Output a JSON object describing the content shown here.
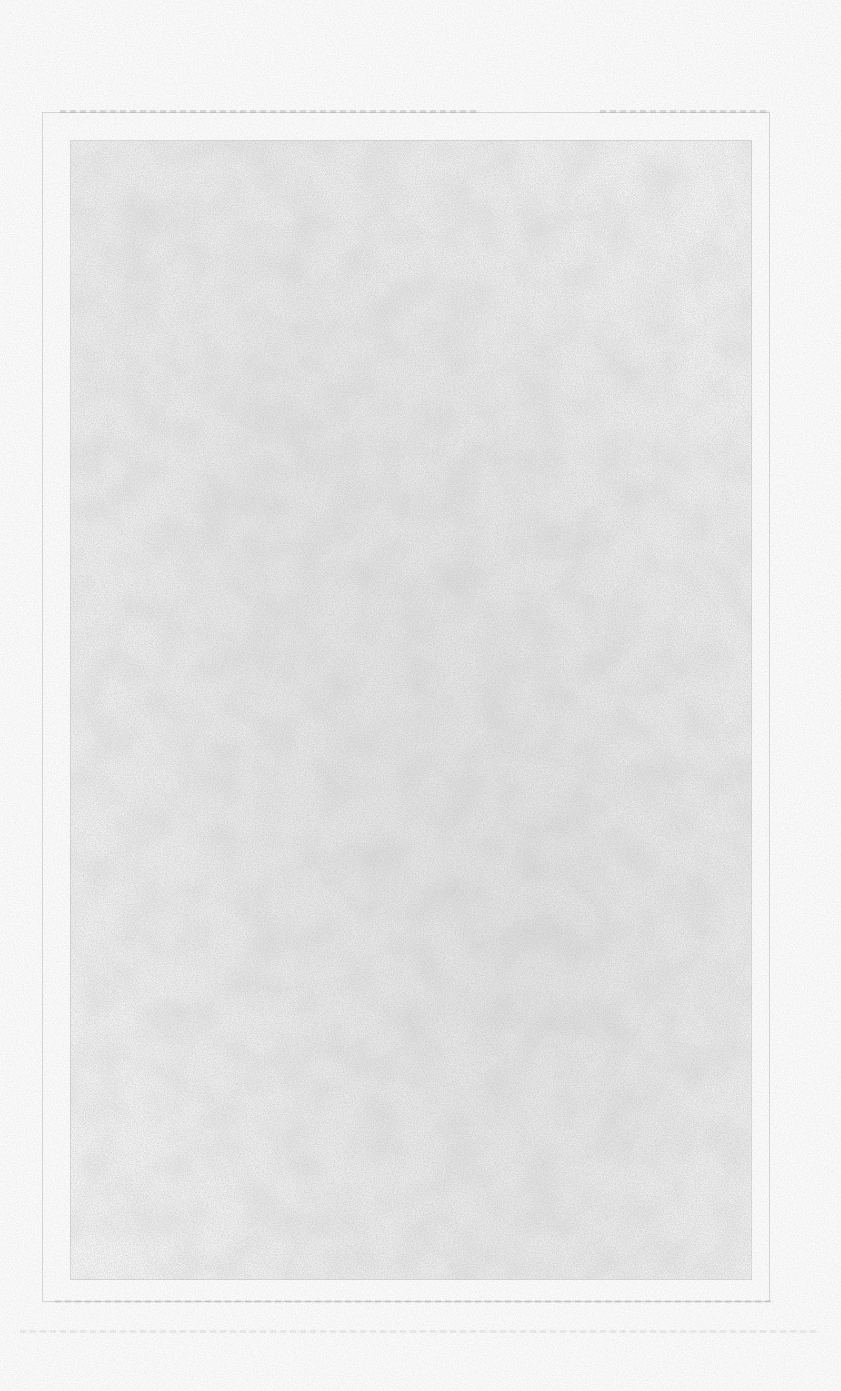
{
  "document": {
    "type": "scanned-blank-page",
    "text": "",
    "has_border_frame": true,
    "colors": {
      "paper": "#fbfbfb",
      "noise": "#a8a8a8",
      "frame": "#969696"
    }
  }
}
